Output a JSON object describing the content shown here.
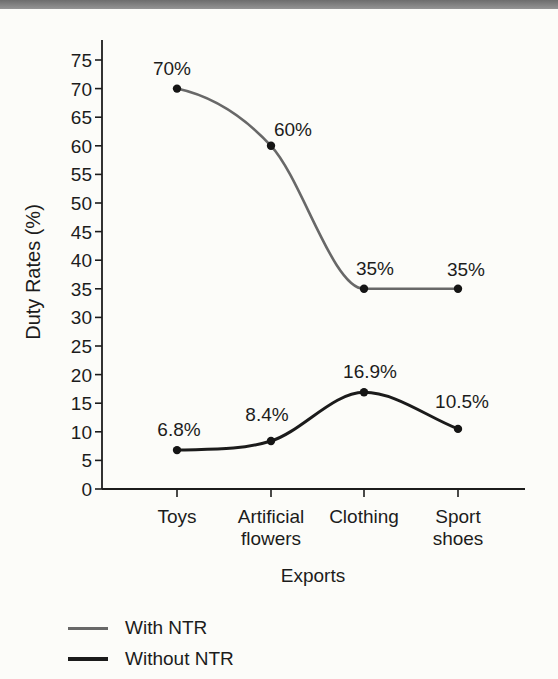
{
  "page": {
    "background_color": "#fcfcf9",
    "top_bar": {
      "color_top": "#6d6d6d",
      "color_bottom": "#959595"
    }
  },
  "chart_data": {
    "type": "line",
    "title": "",
    "xlabel": "Exports",
    "ylabel": "Duty Rates (%)",
    "categories": [
      "Toys",
      "Artificial flowers",
      "Clothing",
      "Sport shoes"
    ],
    "category_label_lines": [
      [
        "Toys"
      ],
      [
        "Artificial",
        "flowers"
      ],
      [
        "Clothing"
      ],
      [
        "Sport",
        "shoes"
      ]
    ],
    "ylim": [
      0,
      75
    ],
    "ytick_step": 5,
    "grid": false,
    "legend_position": "bottom-left",
    "axis_color": "#1c1c1c",
    "text_color": "#1c1c1c",
    "marker_color": "#151515",
    "series": [
      {
        "name": "With NTR",
        "color": "#686868",
        "values": [
          70,
          60,
          35,
          35
        ],
        "point_labels": [
          "70%",
          "60%",
          "35%",
          "35%"
        ],
        "label_offsets": [
          [
            -5,
            -21
          ],
          [
            22,
            -17
          ],
          [
            11,
            -21
          ],
          [
            8,
            -20
          ]
        ]
      },
      {
        "name": "Without NTR",
        "color": "#1b1b1b",
        "values": [
          6.8,
          8.4,
          16.9,
          10.5
        ],
        "point_labels": [
          "6.8%",
          "8.4%",
          "16.9%",
          "10.5%"
        ],
        "label_offsets": [
          [
            2,
            -21
          ],
          [
            -4,
            -27
          ],
          [
            6,
            -21
          ],
          [
            4,
            -28
          ]
        ]
      }
    ]
  }
}
